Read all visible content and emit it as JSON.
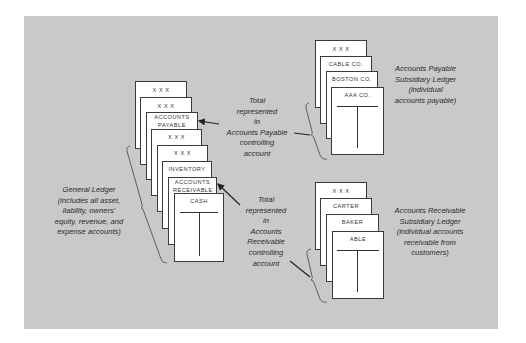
{
  "general_ledger": {
    "cards": [
      {
        "label": "X  X  X"
      },
      {
        "label": "X  X  X"
      },
      {
        "label": "ACCOUNTS PAYABLE"
      },
      {
        "label": "X  X  X"
      },
      {
        "label": "X  X  X"
      },
      {
        "label": "INVENTORY"
      },
      {
        "label": "ACCOUNTS RECEIVABLE"
      },
      {
        "label": "CASH"
      }
    ],
    "caption": [
      "General Ledger",
      "(includes all asset,",
      "liability, owners'",
      "equity, revenue, and",
      "expense accounts)"
    ]
  },
  "ap_subsidiary": {
    "cards": [
      {
        "label": "X  X  X"
      },
      {
        "label": "CABLE CO."
      },
      {
        "label": "BOSTON CO."
      },
      {
        "label": "AAA CO."
      }
    ],
    "caption": [
      "Accounts Payable",
      "Subsidiary Ledger",
      "(individual",
      "accounts payable)"
    ]
  },
  "ar_subsidiary": {
    "cards": [
      {
        "label": "X  X  X"
      },
      {
        "label": "CARTER"
      },
      {
        "label": "BAKER"
      },
      {
        "label": "ABLE"
      }
    ],
    "caption": [
      "Accounts Receivable",
      "Subsidiary Ledger",
      "(individual accounts",
      "receivable from",
      "customers)"
    ]
  },
  "ap_control_note": [
    "Total",
    "represented",
    "in",
    "Accounts Payable",
    "controlling",
    "account"
  ],
  "ar_control_note": [
    "Total",
    "represented",
    "in",
    "Accounts",
    "Receivable",
    "controlling",
    "account"
  ],
  "colors": {
    "panel": "#c9c9c9",
    "card": "#ffffff",
    "line": "#333333"
  }
}
